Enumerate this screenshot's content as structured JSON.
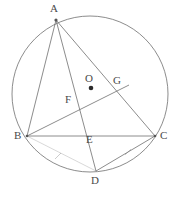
{
  "figure": {
    "stroke_color": "#6e6e6e",
    "label_color": "#4a4a4a",
    "background": "#ffffff",
    "width": 180,
    "height": 203
  },
  "circle": {
    "name": "circumcircle",
    "cx": 90,
    "cy": 94,
    "r": 78
  },
  "center_dot": {
    "label": "O",
    "cx": 91,
    "cy": 88,
    "r": 2.3
  },
  "points": [
    {
      "id": "A",
      "label": "A",
      "x": 56,
      "y": 20,
      "label_x": 50,
      "label_y": 4,
      "on_circle": true,
      "marked": true
    },
    {
      "id": "B",
      "label": "B",
      "x": 27,
      "y": 136,
      "label_x": 14,
      "label_y": 131,
      "on_circle": true,
      "marked": true
    },
    {
      "id": "C",
      "label": "C",
      "x": 155,
      "y": 136,
      "label_x": 160,
      "label_y": 131,
      "on_circle": true,
      "marked": true
    },
    {
      "id": "D",
      "label": "D",
      "x": 96,
      "y": 171,
      "label_x": 91,
      "label_y": 176,
      "on_circle": true,
      "marked": false
    },
    {
      "id": "G",
      "label": "G",
      "x": 122,
      "y": 90,
      "label_x": 113,
      "label_y": 76,
      "on_circle": false,
      "marked": false
    },
    {
      "id": "O",
      "label": "O",
      "x": 91,
      "y": 88,
      "label_x": 85,
      "label_y": 74,
      "on_circle": false,
      "marked": true
    },
    {
      "id": "F",
      "label": "F",
      "x": 77,
      "y": 105,
      "label_x": 66,
      "label_y": 95,
      "on_circle": false,
      "marked": false
    },
    {
      "id": "E",
      "label": "E",
      "x": 86,
      "y": 136,
      "label_x": 86,
      "label_y": 134,
      "on_circle": false,
      "marked": false
    }
  ],
  "segments": [
    {
      "name": "segment-AB",
      "from": "A",
      "to": "B",
      "x1": 56,
      "y1": 20,
      "x2": 27,
      "y2": 136
    },
    {
      "name": "segment-AC",
      "from": "A",
      "to": "C",
      "x1": 56,
      "y1": 20,
      "x2": 155,
      "y2": 136
    },
    {
      "name": "segment-BC",
      "from": "B",
      "to": "C",
      "x1": 27,
      "y1": 136,
      "x2": 155,
      "y2": 136
    },
    {
      "name": "segment-AD",
      "from": "A",
      "to": "D",
      "x1": 56,
      "y1": 20,
      "x2": 96,
      "y2": 171
    },
    {
      "name": "segment-BG",
      "from": "B",
      "to": "G",
      "x1": 27,
      "y1": 136,
      "x2": 129,
      "y2": 85
    },
    {
      "name": "segment-DC",
      "from": "D",
      "to": "C",
      "x1": 96,
      "y1": 171,
      "x2": 155,
      "y2": 136
    },
    {
      "name": "segment-BD",
      "from": "B",
      "to": "D",
      "x1": 27,
      "y1": 136,
      "x2": 96,
      "y2": 171
    }
  ],
  "tick_marks": [
    {
      "name": "tick-BD",
      "cx": 58,
      "cy": 156,
      "angle": 26
    },
    {
      "name": "tick-DC",
      "cx": 128,
      "cy": 152,
      "angle": -31
    }
  ]
}
